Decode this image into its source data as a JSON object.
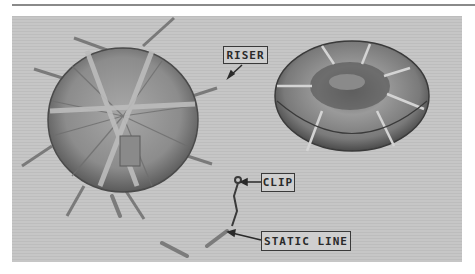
{
  "figure": {
    "labels": {
      "riser": "RISER",
      "clip": "CLIP",
      "static_line": "STATIC LINE"
    },
    "items": [
      {
        "name": "parachute-canopy-top-view",
        "description": "Round packed canopy seen from above with risers radiating"
      },
      {
        "name": "ring-float-packed",
        "description": "Doughnut-shaped packed unit bound with straps"
      }
    ]
  }
}
